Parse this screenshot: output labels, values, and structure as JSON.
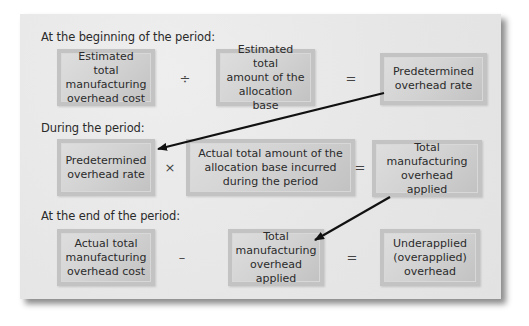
{
  "sections": {
    "beginning": {
      "label": "At the beginning of the period:",
      "box1": "Estimated total\nmanufacturing\noverhead cost",
      "operator1": "÷",
      "box2": "Estimated total\namount of the\nallocation base",
      "operator2": "=",
      "result": "Predetermined\noverhead rate"
    },
    "during": {
      "label": "During the period:",
      "box1": "Predetermined\noverhead rate",
      "operator1": "×",
      "box2": "Actual total amount of the\nallocation base incurred\nduring the period",
      "operator2": "=",
      "result": "Total\nmanufacturing\noverhead applied"
    },
    "end": {
      "label": "At the end of the period:",
      "box1": "Actual total\nmanufacturing\noverhead cost",
      "operator1": "–",
      "box2": "Total\nmanufacturing\noverhead applied",
      "operator2": "=",
      "result": "Underapplied\n(overapplied)\noverhead"
    }
  },
  "arrows": [
    {
      "from": "beginning.result",
      "to": "during.box1"
    },
    {
      "from": "during.result",
      "to": "end.box2"
    }
  ],
  "colors": {
    "panel_bg": "#e9e9e9",
    "box_fill": "#d2d2d2",
    "box_border": "#c3c3c3",
    "arrow": "#111111",
    "text": "#2a2a2a"
  }
}
